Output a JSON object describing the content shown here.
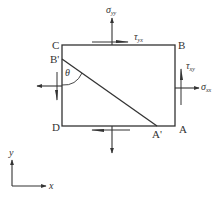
{
  "diagram": {
    "colors": {
      "stroke": "#333333",
      "background": "#ffffff"
    },
    "points": {
      "C": "C",
      "B": "B",
      "B_prime": "B'",
      "D": "D",
      "A": "A",
      "A_prime": "A'"
    },
    "angle_label": "θ",
    "stresses": {
      "sigma_yy": {
        "symbol": "σ",
        "sub": "yy"
      },
      "tau_yx": {
        "symbol": "τ",
        "sub": "yx"
      },
      "tau_xy": {
        "symbol": "τ",
        "sub": "xy"
      },
      "sigma_xx": {
        "symbol": "σ",
        "sub": "xx"
      }
    },
    "axes": {
      "x": "x",
      "y": "y"
    }
  }
}
